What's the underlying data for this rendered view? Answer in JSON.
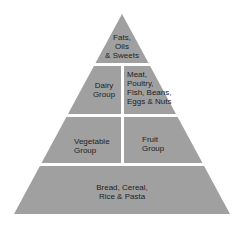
{
  "diagram": {
    "type": "food-pyramid",
    "fill_color": "#a0a0a0",
    "separator_color": "#ffffff",
    "tiers": [
      {
        "level": 1,
        "sections": [
          {
            "label": "Fats,\nOils\n& Sweets"
          }
        ]
      },
      {
        "level": 2,
        "sections": [
          {
            "label": "Dairy\nGroup"
          },
          {
            "label": "Meat,\nPoultry,\nFish, Beans,\nEggs & Nuts"
          }
        ]
      },
      {
        "level": 3,
        "sections": [
          {
            "label": "Vegetable\nGroup"
          },
          {
            "label": "Fruit\nGroup"
          }
        ]
      },
      {
        "level": 4,
        "sections": [
          {
            "label": "Bread, Cereal,\nRice & Pasta"
          }
        ]
      }
    ]
  },
  "labels": {
    "fats": [
      "Fats,",
      "Oils",
      "& Sweets"
    ],
    "dairy": [
      "Dairy",
      "Group"
    ],
    "meat": [
      "Meat,",
      "Poultry,",
      "Fish, Beans,",
      "Eggs & Nuts"
    ],
    "vegetable": [
      "Vegetable",
      "Group"
    ],
    "fruit": [
      "Fruit",
      "Group"
    ],
    "bread": [
      "Bread, Cereal,",
      "Rice & Pasta"
    ]
  }
}
